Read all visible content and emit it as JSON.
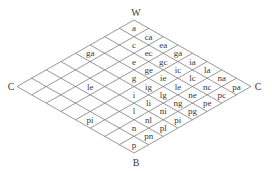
{
  "diagram": {
    "type": "rhombus-grid",
    "grid_size": 8,
    "axis_letters": [
      "a",
      "c",
      "e",
      "g",
      "i",
      "l",
      "n",
      "p"
    ],
    "corners": {
      "top": "W",
      "bottom": "B",
      "left": "C",
      "right": "C"
    },
    "right_half_cells": [
      {
        "u": 0,
        "v": 0,
        "label": "a"
      },
      {
        "u": 1,
        "v": 0,
        "label": "ca"
      },
      {
        "u": 2,
        "v": 0,
        "label": "ea"
      },
      {
        "u": 3,
        "v": 0,
        "label": "ga"
      },
      {
        "u": 4,
        "v": 0,
        "label": "ia"
      },
      {
        "u": 5,
        "v": 0,
        "label": "la"
      },
      {
        "u": 6,
        "v": 0,
        "label": "na"
      },
      {
        "u": 7,
        "v": 0,
        "label": "pa"
      },
      {
        "u": 1,
        "v": 1,
        "label": "c"
      },
      {
        "u": 2,
        "v": 1,
        "label": "ec"
      },
      {
        "u": 3,
        "v": 1,
        "label": "gc"
      },
      {
        "u": 4,
        "v": 1,
        "label": "ic"
      },
      {
        "u": 5,
        "v": 1,
        "label": "lc"
      },
      {
        "u": 6,
        "v": 1,
        "label": "nc"
      },
      {
        "u": 7,
        "v": 1,
        "label": "pc"
      },
      {
        "u": 2,
        "v": 2,
        "label": "e"
      },
      {
        "u": 3,
        "v": 2,
        "label": "ge"
      },
      {
        "u": 4,
        "v": 2,
        "label": "ie"
      },
      {
        "u": 5,
        "v": 2,
        "label": "le"
      },
      {
        "u": 6,
        "v": 2,
        "label": "ne"
      },
      {
        "u": 7,
        "v": 2,
        "label": "pe"
      },
      {
        "u": 3,
        "v": 3,
        "label": "g"
      },
      {
        "u": 4,
        "v": 3,
        "label": "ig"
      },
      {
        "u": 5,
        "v": 3,
        "label": "lg"
      },
      {
        "u": 6,
        "v": 3,
        "label": "ng"
      },
      {
        "u": 7,
        "v": 3,
        "label": "pg"
      },
      {
        "u": 4,
        "v": 4,
        "label": "i"
      },
      {
        "u": 5,
        "v": 4,
        "label": "li"
      },
      {
        "u": 6,
        "v": 4,
        "label": "ni"
      },
      {
        "u": 7,
        "v": 4,
        "label": "pi"
      },
      {
        "u": 5,
        "v": 5,
        "label": "l"
      },
      {
        "u": 6,
        "v": 5,
        "label": "nl"
      },
      {
        "u": 7,
        "v": 5,
        "label": "pl"
      },
      {
        "u": 6,
        "v": 6,
        "label": "n"
      },
      {
        "u": 7,
        "v": 6,
        "label": "pn"
      },
      {
        "u": 7,
        "v": 7,
        "label": "p"
      }
    ],
    "left_half_cells": [
      {
        "u": 0,
        "v": 3,
        "label": "ga"
      },
      {
        "u": 2,
        "v": 5,
        "label": "le"
      },
      {
        "u": 4,
        "v": 7,
        "label": "pi"
      }
    ],
    "colors": {
      "line": "#6b6b6b",
      "text": "#3a3a3a",
      "background": "#ffffff"
    }
  }
}
